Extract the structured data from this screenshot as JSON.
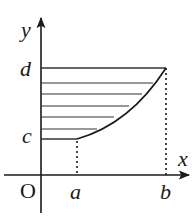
{
  "diagram": {
    "type": "coordinate-region",
    "axes": {
      "x_label": "x",
      "y_label": "y",
      "origin_label": "O"
    },
    "ticks": {
      "x": [
        {
          "label": "a",
          "px": 77
        },
        {
          "label": "b",
          "px": 166
        }
      ],
      "y": [
        {
          "label": "c",
          "px": 139
        },
        {
          "label": "d",
          "px": 68
        }
      ]
    },
    "hatch_lines_y": [
      68,
      83,
      94,
      106,
      117,
      129,
      139
    ],
    "colors": {
      "stroke": "#1a1a1a",
      "hatch": "#333333",
      "background": "#ffffff"
    }
  }
}
